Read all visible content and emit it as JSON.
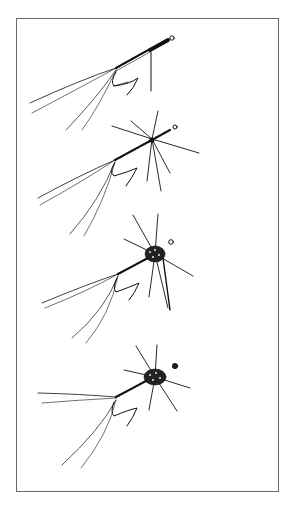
{
  "figure": {
    "border_color": "#6a6a6a",
    "ink_color": "#111111",
    "background": "#ffffff",
    "stages": [
      {
        "index": 1,
        "name": "tail-and-body-wrapped",
        "hackle": false,
        "thorax": false
      },
      {
        "index": 2,
        "name": "hackle-fibers-added",
        "hackle": true,
        "thorax": false
      },
      {
        "index": 3,
        "name": "thorax-dubbed",
        "hackle": true,
        "thorax": true
      },
      {
        "index": 4,
        "name": "finished-fly",
        "hackle": true,
        "thorax": true
      }
    ]
  }
}
